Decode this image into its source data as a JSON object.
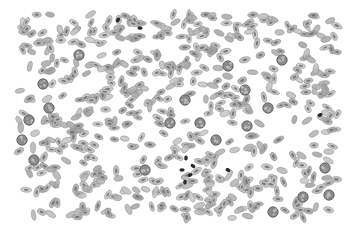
{
  "image": {
    "subject": "blood smear microscopy",
    "width": 358,
    "height": 230,
    "background": "#ffffff",
    "field_bounds": {
      "x": 18,
      "y": 14,
      "w": 320,
      "h": 204
    },
    "cell_color": "#b4b4b4",
    "cell_edge_color": "#8c8c8c",
    "nucleus_color": "#5a5a5a",
    "dark_cell_color": "#2a2a2a",
    "round_cells": [
      [
        79,
        55
      ],
      [
        43,
        84
      ],
      [
        49,
        108
      ],
      [
        29,
        120
      ],
      [
        22,
        140
      ],
      [
        34,
        160
      ],
      [
        145,
        170
      ],
      [
        170,
        123
      ],
      [
        185,
        100
      ],
      [
        228,
        66
      ],
      [
        245,
        90
      ],
      [
        200,
        123
      ],
      [
        282,
        60
      ],
      [
        268,
        108
      ],
      [
        247,
        126
      ],
      [
        325,
        168
      ],
      [
        329,
        195
      ],
      [
        303,
        197
      ],
      [
        273,
        212
      ],
      [
        216,
        140
      ]
    ],
    "dark_clusters": [
      [
        186,
        158
      ],
      [
        182,
        170
      ],
      [
        190,
        175
      ],
      [
        185,
        182
      ],
      [
        193,
        166
      ],
      [
        228,
        170
      ],
      [
        140,
        28
      ],
      [
        118,
        20
      ],
      [
        320,
        115
      ]
    ]
  }
}
